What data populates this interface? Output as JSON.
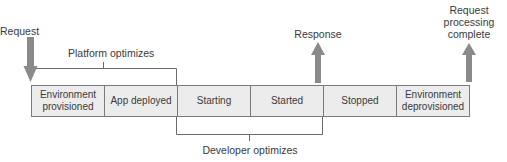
{
  "diagram": {
    "labels": {
      "request": "Request",
      "platform_optimizes": "Platform optimizes",
      "response": "Response",
      "request_complete_line1": "Request",
      "request_complete_line2": "processing",
      "request_complete_line3": "complete",
      "developer_optimizes": "Developer optimizes"
    },
    "stages": [
      {
        "line1": "Environment",
        "line2": "provisioned"
      },
      {
        "line1": "App deployed",
        "line2": ""
      },
      {
        "line1": "Starting",
        "line2": ""
      },
      {
        "line1": "Started",
        "line2": ""
      },
      {
        "line1": "Stopped",
        "line2": ""
      },
      {
        "line1": "Environment",
        "line2": "deprovisioned"
      }
    ],
    "colors": {
      "arrow": "#8a8a8a",
      "box_fill": "#ececec",
      "border": "#7a7a7a",
      "bracket": "#6a6a6a"
    }
  }
}
